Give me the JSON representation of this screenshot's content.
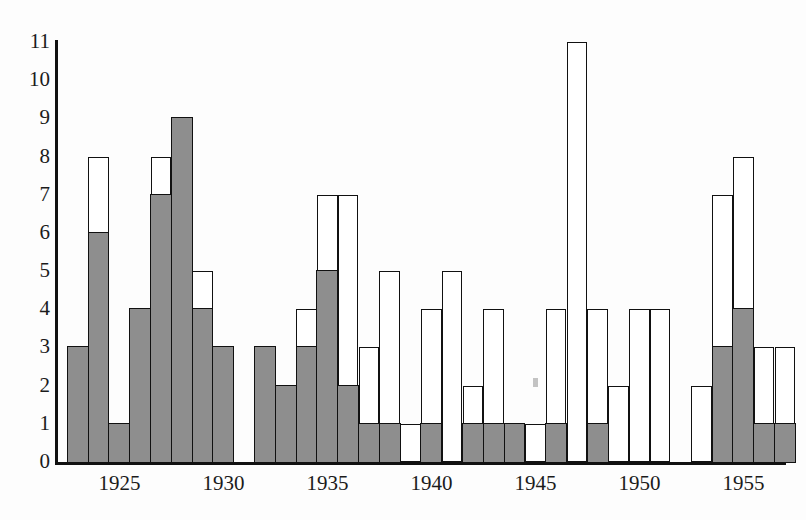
{
  "chart_data": {
    "type": "bar",
    "title": "",
    "subtitle": "",
    "xlabel": "",
    "ylabel": "",
    "stacked": true,
    "grid": false,
    "legend_position": "none",
    "xlim": [
      1922.5,
      1957.5
    ],
    "ylim": [
      0,
      11
    ],
    "y_ticks": [
      0,
      1,
      2,
      3,
      4,
      5,
      6,
      7,
      8,
      9,
      10,
      11
    ],
    "x_ticks": [
      1925,
      1930,
      1935,
      1940,
      1945,
      1950,
      1955
    ],
    "x_tick_labels": [
      "1925",
      "1930",
      "1935",
      "1940",
      "1945",
      "1950",
      "1955"
    ],
    "colors": {
      "filled": "#8e8e8e",
      "open": "#ffffff",
      "outline": "#111111",
      "axis": "#111111",
      "background": "#fdfdfd"
    },
    "categories": [
      1923,
      1924,
      1925,
      1926,
      1927,
      1928,
      1929,
      1930,
      1931,
      1932,
      1933,
      1934,
      1935,
      1936,
      1937,
      1938,
      1939,
      1940,
      1941,
      1942,
      1943,
      1944,
      1945,
      1946,
      1947,
      1948,
      1949,
      1950,
      1951,
      1952,
      1953,
      1954,
      1955,
      1956,
      1957
    ],
    "series": [
      {
        "name": "filled",
        "values": [
          3,
          6,
          1,
          4,
          7,
          9,
          4,
          3,
          0,
          3,
          2,
          3,
          5,
          2,
          1,
          1,
          0,
          1,
          0,
          1,
          1,
          1,
          0,
          1,
          0,
          1,
          0,
          0,
          0,
          0,
          0,
          3,
          4,
          1,
          1
        ]
      },
      {
        "name": "total",
        "values": [
          3,
          8,
          1,
          4,
          8,
          9,
          5,
          3,
          0,
          3,
          2,
          4,
          7,
          7,
          3,
          5,
          1,
          4,
          5,
          2,
          4,
          1,
          1,
          4,
          11,
          4,
          2,
          4,
          4,
          0,
          2,
          7,
          8,
          3,
          3
        ]
      }
    ],
    "annotations": [
      {
        "name": "ink-speck",
        "x": 1945,
        "y": 2.2
      }
    ]
  }
}
